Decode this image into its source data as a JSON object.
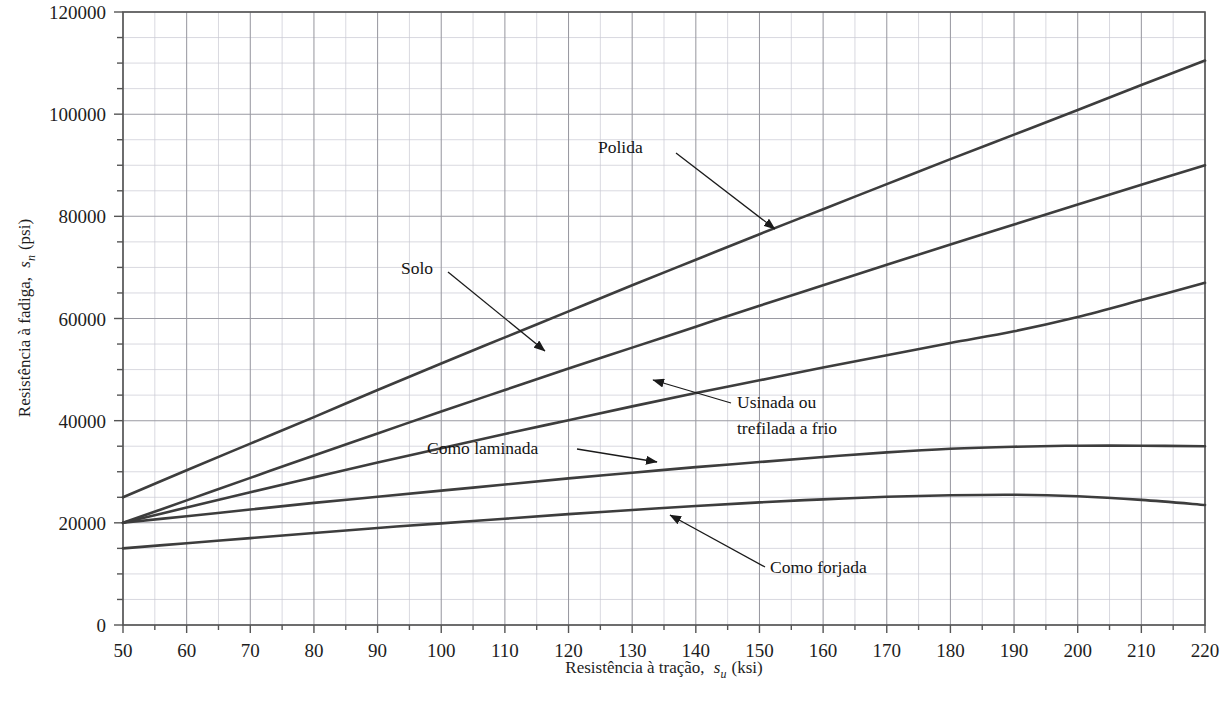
{
  "chart_data": {
    "type": "line",
    "title": "",
    "xlabel": "Resistência à tração, s_u (ksi)",
    "xlabel_main": "Resistência à tração,",
    "xlabel_sym": "s",
    "xlabel_sub": "u",
    "xlabel_unit": "(ksi)",
    "ylabel": "Resistência à fadiga, s_n (psi)",
    "ylabel_main": "Resistência à fadiga,",
    "ylabel_sym": "s",
    "ylabel_sub": "n",
    "ylabel_unit": "(psi)",
    "xlim": [
      50,
      220
    ],
    "ylim": [
      0,
      120000
    ],
    "xticks": [
      50,
      60,
      70,
      80,
      90,
      100,
      110,
      120,
      130,
      140,
      150,
      160,
      170,
      180,
      190,
      200,
      210,
      220
    ],
    "yticks": [
      0,
      20000,
      40000,
      60000,
      80000,
      100000,
      120000
    ],
    "xticklabels": [
      "50",
      "60",
      "70",
      "80",
      "90",
      "100",
      "110",
      "120",
      "130",
      "140",
      "150",
      "160",
      "170",
      "180",
      "190",
      "200",
      "210",
      "220"
    ],
    "yticklabels": [
      "0",
      "20000",
      "40000",
      "60000",
      "80000",
      "100000",
      "120000"
    ],
    "x_minor_step": 5,
    "y_minor_step": 5000,
    "grid": true,
    "grid_major": true,
    "grid_minor": true,
    "legend_position": "inline-annotations",
    "line_color": "#3d3d3d",
    "grid_major_color": "#9a9aa2",
    "grid_minor_color": "#c9c9d2",
    "axis_color": "#555555",
    "x": [
      50,
      60,
      70,
      80,
      90,
      100,
      110,
      120,
      130,
      140,
      150,
      160,
      170,
      180,
      190,
      200,
      210,
      220
    ],
    "series": [
      {
        "name": "Polida",
        "values": [
          25000,
          30300,
          35500,
          40700,
          46000,
          51200,
          56300,
          61400,
          66500,
          71500,
          76500,
          81400,
          86300,
          91200,
          96000,
          100800,
          105700,
          110500
        ]
      },
      {
        "name": "Solo",
        "values": [
          20000,
          24400,
          28800,
          33200,
          37500,
          41800,
          46000,
          50200,
          54300,
          58400,
          62500,
          66500,
          70500,
          74500,
          78400,
          82300,
          86200,
          90000
        ]
      },
      {
        "name": "Usinada ou trefilada a frio",
        "values": [
          20000,
          23000,
          26000,
          28900,
          31800,
          34600,
          37400,
          40100,
          42800,
          45400,
          47900,
          50400,
          52800,
          55200,
          57500,
          60300,
          63600,
          67000
        ]
      },
      {
        "name": "Como laminada",
        "values": [
          20000,
          21300,
          22600,
          23900,
          25100,
          26300,
          27500,
          28700,
          29800,
          30900,
          31900,
          32900,
          33800,
          34500,
          34900,
          35100,
          35100,
          35000
        ]
      },
      {
        "name": "Como forjada",
        "values": [
          15000,
          16000,
          17000,
          18000,
          19000,
          19900,
          20800,
          21700,
          22500,
          23300,
          24000,
          24600,
          25100,
          25400,
          25500,
          25200,
          24500,
          23500
        ]
      }
    ],
    "annotations": [
      {
        "text": "Polida",
        "label_x": 598,
        "label_y": 153,
        "text_anchor": "start",
        "arrow_from_x": 676,
        "arrow_from_y": 153,
        "arrow_to_x": 775,
        "arrow_to_y": 229
      },
      {
        "text": "Solo",
        "label_x": 401,
        "label_y": 274,
        "text_anchor": "start",
        "arrow_from_x": 448,
        "arrow_from_y": 272,
        "arrow_to_x": 545,
        "arrow_to_y": 351
      },
      {
        "text": "Usinada ou",
        "text2": "trefilada a frio",
        "label_x": 737,
        "label_y": 408,
        "label2_y": 434,
        "text_anchor": "start",
        "arrow_from_x": 731,
        "arrow_from_y": 403,
        "arrow_to_x": 653,
        "arrow_to_y": 380
      },
      {
        "text": "Como laminada",
        "label_x": 427,
        "label_y": 454,
        "text_anchor": "start",
        "arrow_from_x": 577,
        "arrow_from_y": 449,
        "arrow_to_x": 657,
        "arrow_to_y": 462
      },
      {
        "text": "Como forjada",
        "label_x": 770,
        "label_y": 573,
        "text_anchor": "start",
        "arrow_from_x": 765,
        "arrow_from_y": 567,
        "arrow_to_x": 670,
        "arrow_to_y": 515
      }
    ]
  }
}
